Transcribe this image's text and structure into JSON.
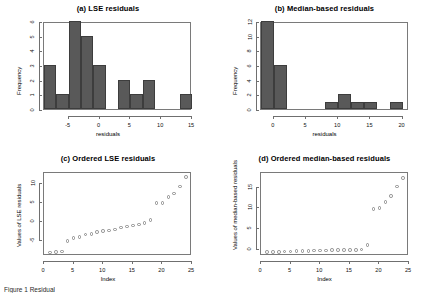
{
  "figure": {
    "caption": "Figure 1 Residual"
  },
  "chart_data": [
    {
      "type": "bar",
      "panel": "a",
      "title": "(a) LSE residuals",
      "xlabel": "residuals",
      "ylabel": "Frequency",
      "xlim": [
        -9,
        15
      ],
      "ylim": [
        0,
        6
      ],
      "xticks": [
        -5,
        0,
        5,
        10,
        15
      ],
      "yticks": [
        0,
        1,
        2,
        3,
        4,
        5,
        6
      ],
      "bin_width": 2,
      "bin_starts": [
        -9,
        -7,
        -5,
        -3,
        -1,
        1,
        3,
        5,
        7,
        9,
        11,
        13
      ],
      "values": [
        3,
        1,
        6,
        5,
        3,
        0,
        2,
        1,
        2,
        0,
        0,
        1
      ],
      "bar_color": "#595959",
      "grid": false
    },
    {
      "type": "bar",
      "panel": "b",
      "title": "(b) Median-based residuals",
      "xlabel": "residuals",
      "ylabel": "Frequency",
      "xlim": [
        -2,
        21
      ],
      "ylim": [
        0,
        12
      ],
      "xticks": [
        0,
        5,
        10,
        15,
        20
      ],
      "yticks": [
        0,
        2,
        4,
        6,
        8,
        10,
        12
      ],
      "bin_width": 2,
      "bin_starts": [
        -2,
        0,
        2,
        4,
        6,
        8,
        10,
        12,
        14,
        16,
        18
      ],
      "values": [
        12,
        6,
        0,
        0,
        0,
        1,
        2,
        1,
        1,
        0,
        1
      ],
      "bar_color": "#595959",
      "grid": false
    },
    {
      "type": "scatter",
      "panel": "c",
      "title": "(c) Ordered LSE residuals",
      "xlabel": "Index",
      "ylabel": "Values of LSE residuals",
      "xlim": [
        0,
        25
      ],
      "ylim": [
        -9,
        13
      ],
      "xticks": [
        0,
        5,
        10,
        15,
        20,
        25
      ],
      "yticks": [
        -5,
        0,
        5,
        10
      ],
      "x": [
        1,
        2,
        3,
        4,
        5,
        6,
        7,
        8,
        9,
        10,
        11,
        12,
        13,
        14,
        15,
        16,
        17,
        18,
        19,
        20,
        21,
        22,
        23,
        24
      ],
      "values": [
        -8.1,
        -7.9,
        -7.8,
        -5.1,
        -4.2,
        -4.0,
        -3.3,
        -3.1,
        -2.6,
        -2.4,
        -2.2,
        -2.0,
        -1.4,
        -1.2,
        -0.9,
        -0.6,
        -0.3,
        0.6,
        5.0,
        5.1,
        6.6,
        7.6,
        9.4,
        12.0
      ],
      "marker": "open-circle",
      "grid": false
    },
    {
      "type": "scatter",
      "panel": "d",
      "title": "(d) Ordered median-based residuals",
      "xlabel": "Index",
      "ylabel": "Values of median-based residuals",
      "xlim": [
        0,
        25
      ],
      "ylim": [
        -1.5,
        18.5
      ],
      "xticks": [
        0,
        5,
        10,
        15,
        20,
        25
      ],
      "yticks": [
        0,
        5,
        10,
        15
      ],
      "x": [
        1,
        2,
        3,
        4,
        5,
        6,
        7,
        8,
        9,
        10,
        11,
        12,
        13,
        14,
        15,
        16,
        17,
        18,
        19,
        20,
        21,
        22,
        23,
        24
      ],
      "values": [
        -0.6,
        -0.6,
        -0.5,
        -0.4,
        -0.4,
        -0.3,
        -0.3,
        -0.3,
        -0.2,
        -0.2,
        -0.2,
        -0.1,
        -0.1,
        -0.1,
        0.0,
        0.0,
        0.1,
        1.2,
        9.8,
        10.0,
        11.5,
        13.0,
        15.2,
        17.3
      ],
      "marker": "open-circle",
      "grid": false
    }
  ]
}
